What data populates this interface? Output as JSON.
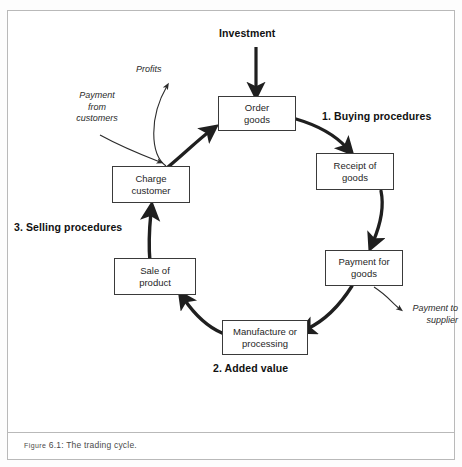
{
  "figure": {
    "caption_prefix": "Figure",
    "caption_number": " 6.1: ",
    "caption_text": "The trading cycle."
  },
  "diagram": {
    "title_flow": "The trading cycle",
    "nodes": [
      {
        "id": "order-goods",
        "label": "Order\ngoods",
        "line1": "Order",
        "line2": "goods"
      },
      {
        "id": "receipt-of-goods",
        "label": "Receipt of\ngoods",
        "line1": "Receipt of",
        "line2": "goods"
      },
      {
        "id": "payment-for-goods",
        "label": "Payment for\ngoods",
        "line1": "Payment for",
        "line2": "goods"
      },
      {
        "id": "manufacture",
        "label": "Manufacture or\nprocessing",
        "line1": "Manufacture or",
        "line2": "processing"
      },
      {
        "id": "sale-of-product",
        "label": "Sale of\nproduct",
        "line1": "Sale of",
        "line2": "product"
      },
      {
        "id": "charge-customer",
        "label": "Charge\ncustomer",
        "line1": "Charge",
        "line2": "customer"
      }
    ],
    "stage_labels": [
      {
        "id": "stage-1",
        "text": "1. Buying procedures"
      },
      {
        "id": "stage-2",
        "text": "2. Added value"
      },
      {
        "id": "stage-3",
        "text": "3. Selling procedures"
      }
    ],
    "flow_labels": [
      {
        "id": "investment",
        "text": "Investment"
      },
      {
        "id": "profits",
        "text": "Profits"
      },
      {
        "id": "payment-from-customers",
        "text": "Payment\nfrom\ncustomers",
        "l1": "Payment",
        "l2": "from",
        "l3": "customers"
      },
      {
        "id": "payment-to-supplier",
        "text": "Payment to\nsupplier",
        "l1": "Payment to",
        "l2": "supplier"
      }
    ]
  },
  "colors": {
    "frame_border": "#b9b9b9",
    "node_border": "#3a3a3a",
    "arrow_thick": "#1f1f1f",
    "arrow_thin": "#2b2b2b",
    "text": "#262626"
  }
}
